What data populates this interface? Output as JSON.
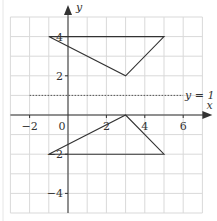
{
  "diagram": {
    "type": "coordinate-grid",
    "axes": {
      "x_label": "x",
      "y_label": "y",
      "x_range": [
        -3,
        7
      ],
      "y_range": [
        -5,
        5
      ],
      "x_ticks": [
        {
          "value": -2,
          "label": "−2"
        },
        {
          "value": 0,
          "label": "0"
        },
        {
          "value": 2,
          "label": "2"
        },
        {
          "value": 4,
          "label": "4"
        },
        {
          "value": 6,
          "label": "6"
        }
      ],
      "y_ticks": [
        {
          "value": 4,
          "label": "4"
        },
        {
          "value": 2,
          "label": "2"
        },
        {
          "value": -2,
          "label": "−2"
        },
        {
          "value": -4,
          "label": "−4"
        }
      ]
    },
    "mirror_line": {
      "equation": "y = 1",
      "label": "y = 1",
      "style": "dotted"
    },
    "shapes": [
      {
        "name": "upper-triangle",
        "vertices": [
          [
            -1,
            4
          ],
          [
            5,
            4
          ],
          [
            3,
            2
          ]
        ]
      },
      {
        "name": "lower-triangle",
        "vertices": [
          [
            -1,
            -2
          ],
          [
            5,
            -2
          ],
          [
            3,
            0
          ]
        ]
      }
    ],
    "colors": {
      "grid": "#d9d9d9",
      "axis": "#333333",
      "shape": "#333333",
      "mirror_line": "#555555"
    }
  }
}
